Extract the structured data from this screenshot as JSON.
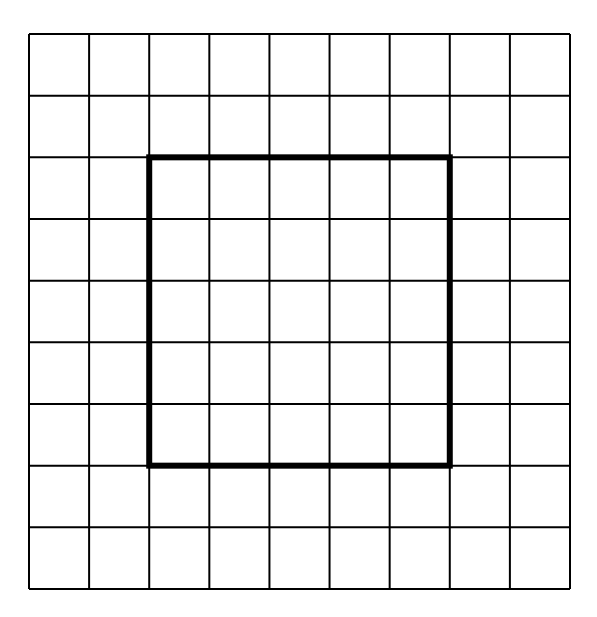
{
  "diagram": {
    "type": "grid",
    "rows": 9,
    "cols": 9,
    "grid_origin": [
      29,
      34
    ],
    "grid_size": [
      541,
      555
    ],
    "line_color": "#000000",
    "background": "#ffffff",
    "highlight_square": {
      "start_col": 2,
      "start_row": 2,
      "end_col": 7,
      "end_row": 7,
      "width_cells": 5,
      "height_cells": 5,
      "stroke_width": 6
    }
  }
}
